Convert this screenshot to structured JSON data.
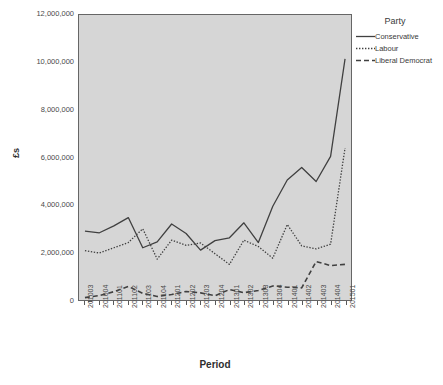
{
  "chart_data": {
    "type": "line",
    "title": "",
    "xlabel": "Period",
    "ylabel": "£s",
    "ylim": [
      0,
      12000000
    ],
    "ytick_step": 2000000,
    "ytick_labels": [
      "0",
      "2,000,000",
      "4,000,000",
      "6,000,000",
      "8,000,000",
      "10,000,000",
      "12,000,000"
    ],
    "ytick_values": [
      0,
      2000000,
      4000000,
      6000000,
      8000000,
      10000000,
      12000000
    ],
    "grid": false,
    "legend_position": "right",
    "legend_title": "Party",
    "categories": [
      "201003",
      "201004",
      "201101",
      "201102",
      "201103",
      "201104",
      "201201",
      "201202",
      "201203",
      "201204",
      "201301",
      "201302",
      "201303",
      "201304",
      "201401",
      "201402",
      "201403",
      "201404",
      "201501"
    ],
    "series": [
      {
        "name": "Conservative",
        "dash": "solid",
        "values": [
          2900000,
          2830000,
          3120000,
          3470000,
          2200000,
          2450000,
          3200000,
          2800000,
          2100000,
          2500000,
          2620000,
          3250000,
          2420000,
          3950000,
          5050000,
          5580000,
          4990000,
          6050000,
          10150000
        ]
      },
      {
        "name": "Labour",
        "dash": "dotted",
        "values": [
          2080000,
          1980000,
          2200000,
          2420000,
          3000000,
          1720000,
          2520000,
          2300000,
          2400000,
          1950000,
          1500000,
          2520000,
          2250000,
          1760000,
          3180000,
          2280000,
          2150000,
          2350000,
          6400000
        ]
      },
      {
        "name": "Liberal Democrat",
        "dash": "dashed",
        "values": [
          100000,
          190000,
          350000,
          570000,
          280000,
          150000,
          230000,
          360000,
          300000,
          180000,
          440000,
          310000,
          400000,
          590000,
          540000,
          510000,
          1620000,
          1450000,
          1500000
        ]
      }
    ],
    "colors": {
      "line": "#404040",
      "plot_background": "#d6d6d6",
      "page_background": "#ffffff",
      "axis": "#666666",
      "text": "#3a3a3a"
    }
  },
  "legend": {
    "title": "Party",
    "entries": [
      {
        "label": "Conservative",
        "style": "solid"
      },
      {
        "label": "Labour",
        "style": "dotted"
      },
      {
        "label": "Liberal Democrat",
        "style": "dashed"
      }
    ]
  },
  "axes": {
    "x_title": "Period",
    "y_title": "£s"
  }
}
